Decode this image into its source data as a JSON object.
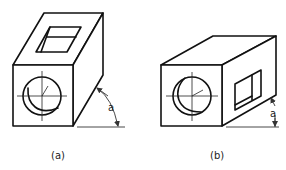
{
  "figures": [
    {
      "id": "a",
      "caption": "(a)",
      "dimension_label": "a",
      "description": "Oblique view of a rectangular block with a square through-hole on the top face and a circular hole on the front face; angle a measured between the receding edge and the horizontal"
    },
    {
      "id": "b",
      "caption": "(b)",
      "dimension_label": "a",
      "description": "Oblique view of a rectangular block with a square through-hole on the right side face and a circular hole on the front face; offset a measured vertically"
    }
  ],
  "colors": {
    "line": "#111111",
    "background": "#ffffff"
  }
}
